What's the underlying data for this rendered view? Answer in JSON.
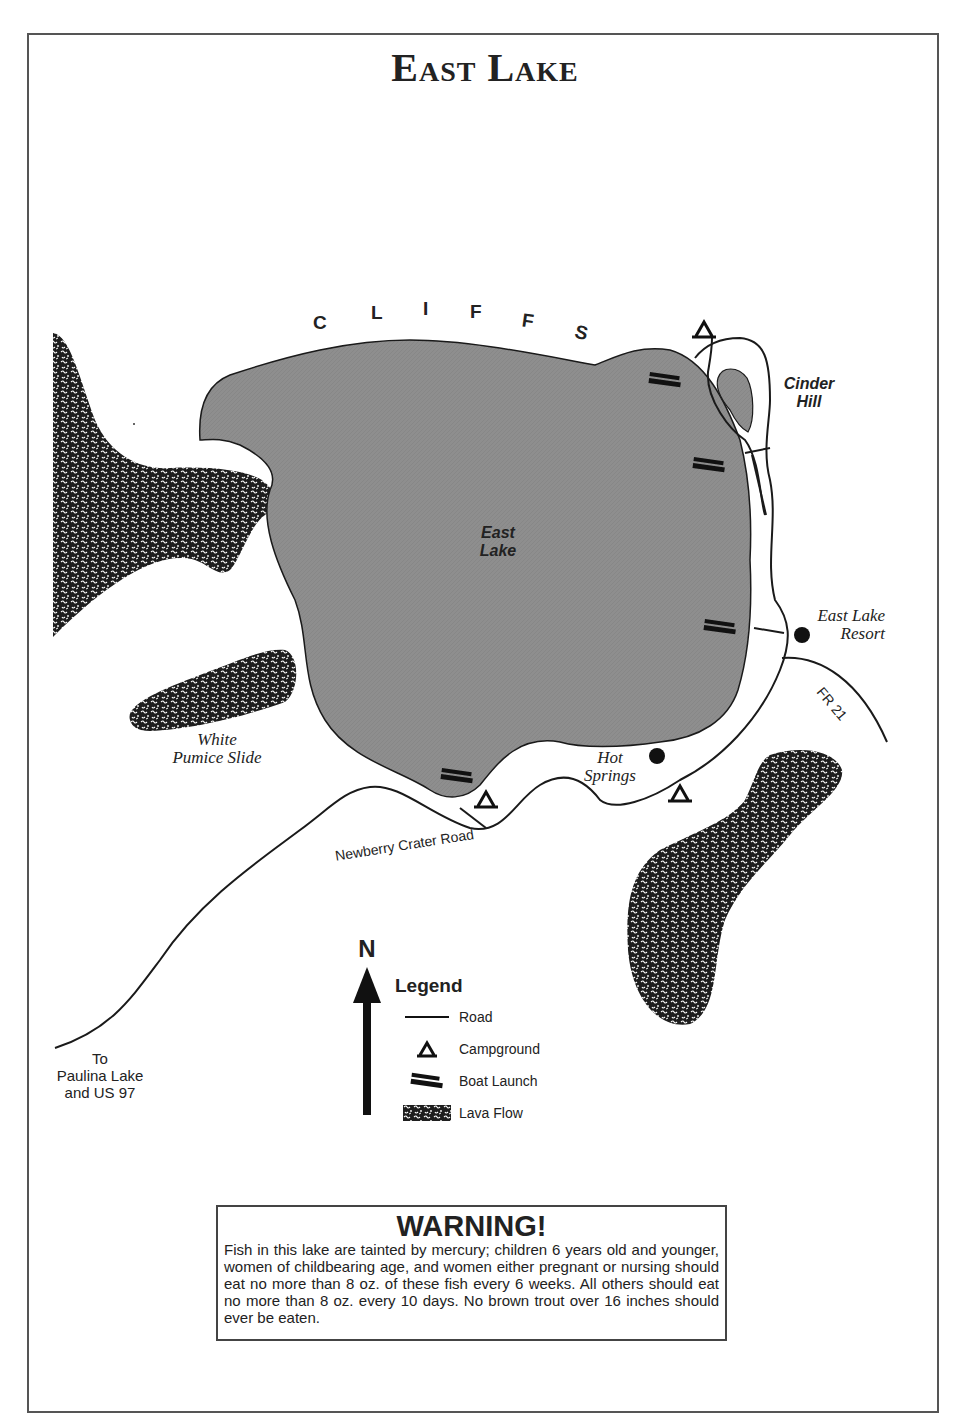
{
  "title": "East Lake",
  "colors": {
    "lake_fill": "#8c8c8c",
    "lava_fill": "#1e1e1e",
    "line": "#1a1a1a",
    "background": "#ffffff"
  },
  "map": {
    "cliffs_label": [
      "C",
      "L",
      "I",
      "F",
      "F",
      "S"
    ],
    "lake_label": [
      "East",
      "Lake"
    ],
    "cinder_hill_label": [
      "Cinder",
      "Hill"
    ],
    "resort_label": [
      "East Lake",
      "Resort"
    ],
    "hot_springs_label": [
      "Hot",
      "Springs"
    ],
    "pumice_label": [
      "White",
      "Pumice Slide"
    ],
    "road_fr21_label": "FR 21",
    "road_newberry_label": "Newberry Crater Road",
    "destination_label": [
      "To",
      "Paulina Lake",
      "and US 97"
    ],
    "boat_launch_count": 4,
    "campground_count": 3,
    "point_features": [
      "East Lake Resort",
      "Hot Springs"
    ]
  },
  "compass": {
    "label": "N"
  },
  "legend": {
    "title": "Legend",
    "items": [
      {
        "symbol": "road-line-icon",
        "label": "Road"
      },
      {
        "symbol": "campground-icon",
        "label": "Campground"
      },
      {
        "symbol": "boat-launch-icon",
        "label": "Boat Launch"
      },
      {
        "symbol": "lava-flow-icon",
        "label": "Lava Flow"
      }
    ]
  },
  "warning": {
    "title": "WARNING!",
    "body": "Fish in this lake are tainted by mercury; children 6 years old and younger, women of childbearing age, and women either pregnant or nursing should eat no more than 8 oz. of these fish every 6 weeks. All others should  eat no more than 8 oz. every 10 days. No brown trout over 16 inches should ever be eaten."
  }
}
